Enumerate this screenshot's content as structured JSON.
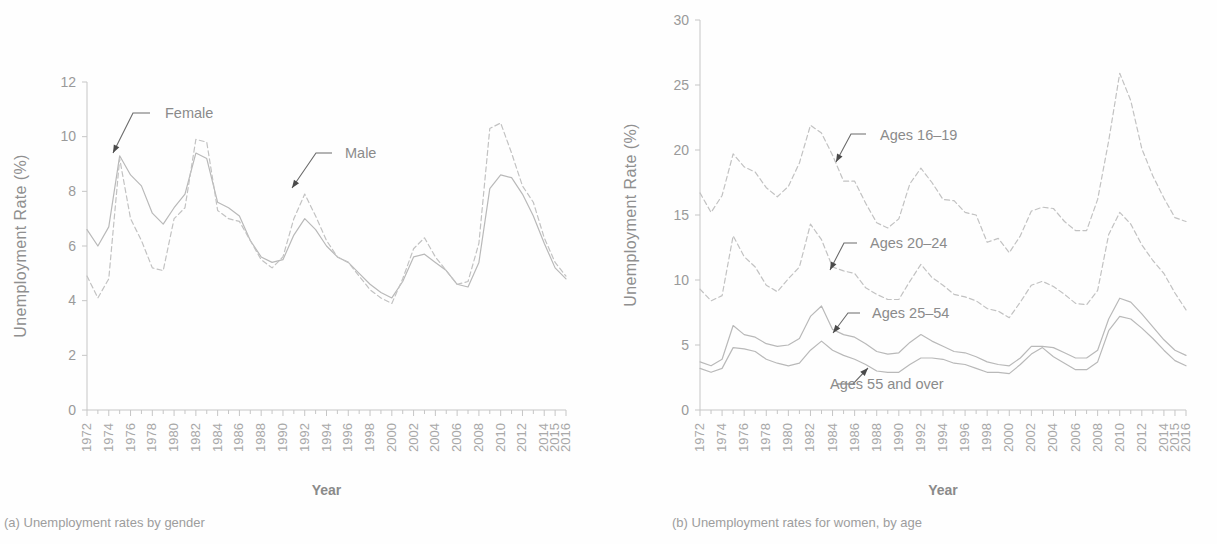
{
  "figure": {
    "panels": [
      {
        "id": "a",
        "caption": "(a) Unemployment rates by gender",
        "ylabel": "Unemployment Rate (%)",
        "xlabel": "Year",
        "annotations": [
          {
            "label": "Female",
            "text_x": 165,
            "text_y": 118,
            "leader": "M150,113 L133,113 L113,153",
            "tip_x": 113,
            "tip_y": 153,
            "anchor": "start"
          },
          {
            "label": "Male",
            "text_x": 345,
            "text_y": 158,
            "leader": "M332,153 L316,153 L292,188",
            "tip_x": 292,
            "tip_y": 188,
            "anchor": "start"
          }
        ]
      },
      {
        "id": "b",
        "caption": "(b) Unemployment rates for women, by age",
        "ylabel": "Unemployment Rate (%)",
        "xlabel": "Year",
        "annotations": [
          {
            "label": "Ages 16–19",
            "text_x": 272,
            "text_y": 140,
            "leader": "M258,134 L243,134 L228,162",
            "tip_x": 228,
            "tip_y": 162,
            "anchor": "start"
          },
          {
            "label": "Ages 20–24",
            "text_x": 262,
            "text_y": 248,
            "leader": "M249,243 L236,243 L222,270",
            "tip_x": 222,
            "tip_y": 270,
            "anchor": "start"
          },
          {
            "label": "Ages 25–54",
            "text_x": 264,
            "text_y": 318,
            "leader": "M252,313 L240,313 L225,333",
            "tip_x": 225,
            "tip_y": 333,
            "anchor": "start"
          },
          {
            "label": "Ages 55 and over",
            "text_x": 222,
            "text_y": 389,
            "leader": "M229,384 L245,384 L260,368",
            "tip_x": 260,
            "tip_y": 368,
            "anchor": "start"
          }
        ]
      }
    ]
  },
  "chart_data": [
    {
      "type": "line",
      "panel": "a",
      "title": "(a) Unemployment rates by gender",
      "xlabel": "Year",
      "ylabel": "Unemployment Rate (%)",
      "ylim": [
        0,
        12
      ],
      "yticks": [
        0,
        2,
        4,
        6,
        8,
        10,
        12
      ],
      "grid": false,
      "legend": "inline annotations",
      "x": [
        1972,
        1973,
        1974,
        1975,
        1976,
        1977,
        1978,
        1979,
        1980,
        1981,
        1982,
        1983,
        1984,
        1985,
        1986,
        1987,
        1988,
        1989,
        1990,
        1991,
        1992,
        1993,
        1994,
        1995,
        1996,
        1997,
        1998,
        1999,
        2000,
        2001,
        2002,
        2003,
        2004,
        2005,
        2006,
        2007,
        2008,
        2009,
        2010,
        2011,
        2012,
        2013,
        2014,
        2015,
        2016
      ],
      "xticks": [
        "1972",
        "1974",
        "1976",
        "1978",
        "1980",
        "1982",
        "1984",
        "1986",
        "1988",
        "1990",
        "1992",
        "1994",
        "1996",
        "1998",
        "2000",
        "2002",
        "2004",
        "2006",
        "2008",
        "2010",
        "2012",
        "2014",
        "2015",
        "2016"
      ],
      "series": [
        {
          "name": "Female",
          "style": "solid",
          "values": [
            6.6,
            6.0,
            6.7,
            9.3,
            8.6,
            8.2,
            7.2,
            6.8,
            7.4,
            7.9,
            9.4,
            9.2,
            7.6,
            7.4,
            7.1,
            6.2,
            5.6,
            5.4,
            5.5,
            6.4,
            7.0,
            6.6,
            6.0,
            5.6,
            5.4,
            5.0,
            4.6,
            4.3,
            4.1,
            4.7,
            5.6,
            5.7,
            5.4,
            5.1,
            4.6,
            4.5,
            5.4,
            8.1,
            8.6,
            8.5,
            7.9,
            7.1,
            6.1,
            5.2,
            4.8
          ]
        },
        {
          "name": "Male",
          "style": "dashed",
          "values": [
            4.9,
            4.1,
            4.8,
            9.2,
            7.0,
            6.2,
            5.2,
            5.1,
            7.0,
            7.4,
            9.9,
            9.8,
            7.3,
            7.0,
            6.9,
            6.2,
            5.5,
            5.2,
            5.6,
            7.0,
            7.9,
            7.1,
            6.2,
            5.6,
            5.4,
            4.9,
            4.4,
            4.1,
            3.9,
            4.8,
            5.9,
            6.3,
            5.6,
            5.1,
            4.6,
            4.7,
            6.1,
            10.3,
            10.5,
            9.4,
            8.2,
            7.6,
            6.3,
            5.4,
            4.9
          ]
        }
      ]
    },
    {
      "type": "line",
      "panel": "b",
      "title": "(b) Unemployment rates for women, by age",
      "xlabel": "Year",
      "ylabel": "Unemployment Rate (%)",
      "ylim": [
        0,
        30
      ],
      "yticks": [
        0,
        5,
        10,
        15,
        20,
        25,
        30
      ],
      "grid": false,
      "legend": "inline annotations",
      "x": [
        1972,
        1973,
        1974,
        1975,
        1976,
        1977,
        1978,
        1979,
        1980,
        1981,
        1982,
        1983,
        1984,
        1985,
        1986,
        1987,
        1988,
        1989,
        1990,
        1991,
        1992,
        1993,
        1994,
        1995,
        1996,
        1997,
        1998,
        1999,
        2000,
        2001,
        2002,
        2003,
        2004,
        2005,
        2006,
        2007,
        2008,
        2009,
        2010,
        2011,
        2012,
        2013,
        2014,
        2015,
        2016
      ],
      "xticks": [
        "1972",
        "1974",
        "1976",
        "1978",
        "1980",
        "1982",
        "1984",
        "1986",
        "1988",
        "1990",
        "1992",
        "1994",
        "1996",
        "1998",
        "2000",
        "2002",
        "2004",
        "2006",
        "2008",
        "2010",
        "2012",
        "2014",
        "2015",
        "2016"
      ],
      "series": [
        {
          "name": "Ages 16–19",
          "style": "dashed",
          "values": [
            16.7,
            15.2,
            16.5,
            19.7,
            18.7,
            18.3,
            17.1,
            16.4,
            17.2,
            19.0,
            21.9,
            21.3,
            19.6,
            17.6,
            17.6,
            15.9,
            14.4,
            14.0,
            14.7,
            17.4,
            18.6,
            17.5,
            16.2,
            16.1,
            15.2,
            15.0,
            12.9,
            13.2,
            12.1,
            13.4,
            15.3,
            15.6,
            15.5,
            14.5,
            13.8,
            13.8,
            16.2,
            20.7,
            25.9,
            23.8,
            20.1,
            18.0,
            16.3,
            14.8,
            14.5
          ]
        },
        {
          "name": "Ages 20–24",
          "style": "dashed",
          "values": [
            9.3,
            8.4,
            8.8,
            13.4,
            11.8,
            11.0,
            9.6,
            9.1,
            10.1,
            11.0,
            14.3,
            13.1,
            11.0,
            10.7,
            10.5,
            9.4,
            8.9,
            8.5,
            8.5,
            9.9,
            11.2,
            10.2,
            9.6,
            8.9,
            8.7,
            8.4,
            7.8,
            7.6,
            7.1,
            8.3,
            9.6,
            9.9,
            9.5,
            8.9,
            8.2,
            8.1,
            9.2,
            13.5,
            15.2,
            14.3,
            12.7,
            11.5,
            10.5,
            9.0,
            7.7
          ]
        },
        {
          "name": "Ages 25–54",
          "style": "solid",
          "values": [
            3.7,
            3.4,
            3.9,
            6.5,
            5.8,
            5.6,
            5.1,
            4.9,
            5.0,
            5.5,
            7.2,
            8.0,
            6.2,
            5.8,
            5.6,
            5.1,
            4.5,
            4.3,
            4.4,
            5.2,
            5.8,
            5.3,
            4.9,
            4.5,
            4.4,
            4.1,
            3.7,
            3.5,
            3.4,
            4.0,
            4.9,
            4.9,
            4.8,
            4.4,
            4.0,
            4.0,
            4.6,
            7.0,
            8.6,
            8.3,
            7.4,
            6.4,
            5.4,
            4.6,
            4.2
          ]
        },
        {
          "name": "Ages 55 and over",
          "style": "solid",
          "values": [
            3.2,
            2.9,
            3.2,
            4.8,
            4.7,
            4.5,
            3.9,
            3.6,
            3.4,
            3.6,
            4.6,
            5.3,
            4.6,
            4.2,
            3.9,
            3.5,
            3.0,
            2.9,
            2.9,
            3.5,
            4.0,
            4.0,
            3.9,
            3.6,
            3.5,
            3.2,
            2.9,
            2.9,
            2.8,
            3.5,
            4.3,
            4.8,
            4.1,
            3.6,
            3.1,
            3.1,
            3.7,
            6.1,
            7.2,
            7.0,
            6.3,
            5.5,
            4.6,
            3.8,
            3.4
          ]
        }
      ]
    }
  ]
}
